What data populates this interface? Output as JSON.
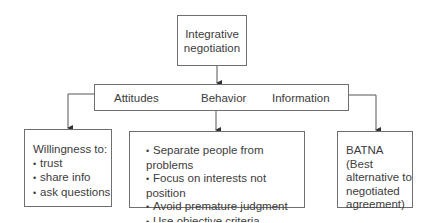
{
  "top": {
    "line1": "Integrative",
    "line2": "negotiation"
  },
  "middle": {
    "labels": [
      "Attitudes",
      "Behavior",
      "Information"
    ]
  },
  "left_box": {
    "heading": "Willingness to:",
    "items": [
      "trust",
      "share info",
      "ask questions"
    ]
  },
  "center_box": {
    "items": [
      "Separate people from problems",
      "Focus on interests not position",
      "Avoid premature judgment",
      "Use objective criteria"
    ]
  },
  "right_box": {
    "lines": [
      "BATNA (Best",
      "alternative to",
      "negotiated",
      "agreement)"
    ]
  }
}
